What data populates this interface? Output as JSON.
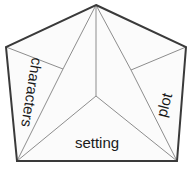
{
  "diagram": {
    "shape": "pentagon",
    "background_color": "#ffffff",
    "outline_color": "#3a3a3a",
    "fold_line_color": "#8d8d8d",
    "label_color": "#1a1a1a",
    "panels": [
      {
        "id": "characters",
        "label": "characters",
        "position": "left",
        "rotation_deg": 99
      },
      {
        "id": "plot",
        "label": "plot",
        "position": "right",
        "rotation_deg": -75
      },
      {
        "id": "setting",
        "label": "setting",
        "position": "bottom",
        "rotation_deg": 0
      }
    ],
    "geometry": {
      "apex": "96,5",
      "top_left": "6,47",
      "top_right": "186,47",
      "bottom_left": "17,161",
      "bottom_right": "177,161",
      "center": "96,96",
      "left_fold_junction": "63,69",
      "right_fold_junction": "131,70",
      "outline_points": "96,5 186,47 177,161 17,161 6,47",
      "spoke_center_to_apex": "M96,96 L96,5",
      "spoke_center_to_bottom_left": "M96,96 L17,161",
      "spoke_center_to_bottom_right": "M96,96 L177,161",
      "fold_left_edge": "M6,47 L63,69",
      "fold_right_edge": "M186,47 L131,70",
      "fold_left_to_apex": "M63,69 L96,5",
      "fold_right_to_apex": "M131,70 L96,5",
      "fold_left_to_bottom": "M63,69 L17,161",
      "fold_right_to_bottom": "M131,70 L177,161"
    }
  }
}
